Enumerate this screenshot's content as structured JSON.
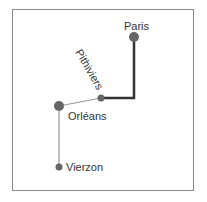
{
  "diagram": {
    "type": "route-map",
    "nodes": [
      {
        "id": "paris",
        "label": "Paris",
        "x": 134,
        "y": 37,
        "r": 5
      },
      {
        "id": "pithiviers",
        "label": "Pithiviers",
        "x": 101,
        "y": 98,
        "r": 3.5
      },
      {
        "id": "orleans",
        "label": "Orléans",
        "x": 59,
        "y": 106,
        "r": 5
      },
      {
        "id": "vierzon",
        "label": "Vierzon",
        "x": 59,
        "y": 167,
        "r": 3.5
      }
    ],
    "edges": [
      {
        "from": "paris",
        "to": "pithiviers",
        "style": "thick",
        "via": [
          134,
          98
        ]
      },
      {
        "from": "pithiviers",
        "to": "orleans",
        "style": "thin"
      },
      {
        "from": "orleans",
        "to": "vierzon",
        "style": "thin"
      }
    ],
    "colors": {
      "node": "#666666",
      "thick_edge": "#333333",
      "thin_edge": "#999999",
      "border": "#888888"
    }
  }
}
